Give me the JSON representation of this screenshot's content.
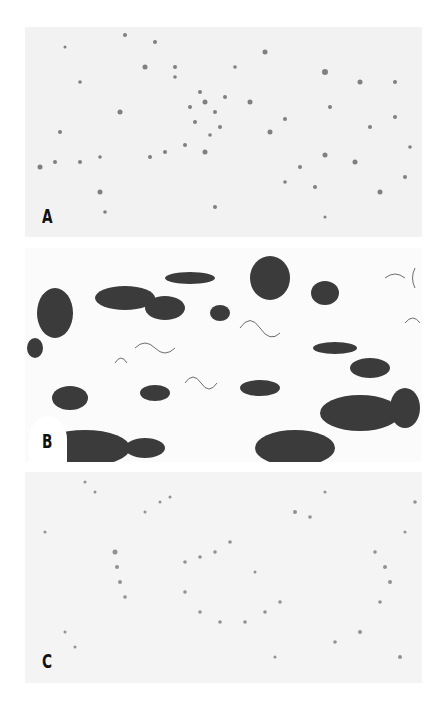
{
  "figure": {
    "panels": [
      {
        "label": "A",
        "description": "sparse scattered dark micro-aggregates on light gray background",
        "density": "low",
        "background": "#f2f2f2",
        "particle_color": "#555555"
      },
      {
        "label": "B",
        "description": "dense dark tangled filamentous clusters on white background",
        "density": "high",
        "background": "#fbfbfb",
        "particle_color": "#1a1a1a"
      },
      {
        "label": "C",
        "description": "fine gray dotted particles forming loose network on light gray background",
        "density": "medium",
        "background": "#f4f4f4",
        "particle_color": "#777777"
      }
    ]
  }
}
